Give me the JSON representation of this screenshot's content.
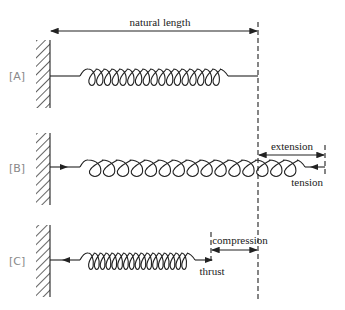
{
  "diagram": {
    "labels": {
      "natural_length": "natural length",
      "extension": "extension",
      "tension": "tension",
      "compression": "compression",
      "thrust": "thrust"
    },
    "panels": [
      {
        "id": "A",
        "tag": "[A]",
        "state": "natural length",
        "coils": 17
      },
      {
        "id": "B",
        "tag": "[B]",
        "state": "stretched",
        "coils": 15
      },
      {
        "id": "C",
        "tag": "[C]",
        "state": "compressed",
        "coils": 17
      }
    ],
    "colors": {
      "line": "#222222",
      "tag": "#888888",
      "background": "#ffffff"
    }
  }
}
